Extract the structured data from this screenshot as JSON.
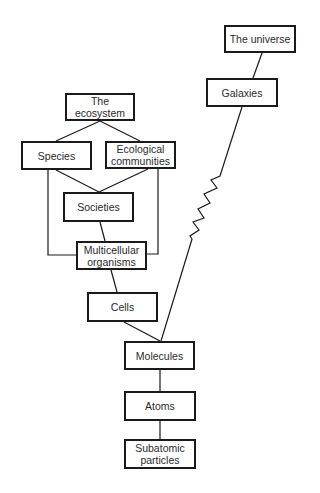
{
  "diagram": {
    "nodes": {
      "universe": "The universe",
      "galaxies": "Galaxies",
      "ecosystem": "The ecosystem",
      "species": "Species",
      "ecological_communities": "Ecological communities",
      "societies": "Societies",
      "multicellular": "Multicellular organisms",
      "cells": "Cells",
      "molecules": "Molecules",
      "atoms": "Atoms",
      "subatomic": "Subatomic particles"
    },
    "edges": [
      [
        "The universe",
        "Galaxies"
      ],
      [
        "Galaxies",
        "Molecules"
      ],
      [
        "The ecosystem",
        "Species"
      ],
      [
        "The ecosystem",
        "Ecological communities"
      ],
      [
        "Species",
        "Societies"
      ],
      [
        "Ecological communities",
        "Societies"
      ],
      [
        "Species",
        "Multicellular organisms"
      ],
      [
        "Ecological communities",
        "Multicellular organisms"
      ],
      [
        "Societies",
        "Multicellular organisms"
      ],
      [
        "Multicellular organisms",
        "Cells"
      ],
      [
        "Cells",
        "Molecules"
      ],
      [
        "Molecules",
        "Atoms"
      ],
      [
        "Atoms",
        "Subatomic particles"
      ]
    ],
    "colors": {
      "line": "#1a1a1a",
      "text": "#2a2a2a",
      "background": "#ffffff"
    }
  }
}
